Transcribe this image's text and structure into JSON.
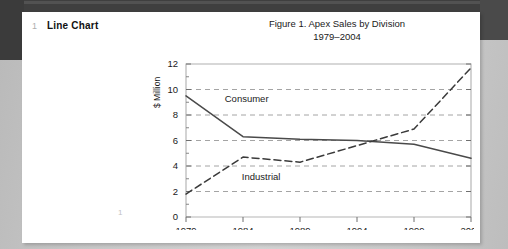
{
  "document": {
    "section_number": "1",
    "section_title": "Line Chart",
    "folio": "1"
  },
  "chart_data": {
    "type": "line",
    "title": "Figure 1.  Apex Sales by Division",
    "subtitle": "1979–2004",
    "xlabel": "",
    "ylabel": "$ Million",
    "categories": [
      "1979",
      "1984",
      "1989",
      "1994",
      "1999",
      "2004"
    ],
    "x": [
      1979,
      1984,
      1989,
      1994,
      1999,
      2004
    ],
    "xlim": [
      1979,
      2004
    ],
    "ylim": [
      0,
      12
    ],
    "yticks": [
      "0",
      "2",
      "4",
      "6",
      "8",
      "10",
      "12"
    ],
    "ytick_values": [
      0,
      2,
      4,
      6,
      8,
      10,
      12
    ],
    "grid": "horizontal-dashed",
    "legend": "inline-annotations",
    "series": [
      {
        "name": "Consumer",
        "style": "solid",
        "color": "#4a4a4a",
        "values": [
          9.5,
          6.3,
          6.1,
          6.0,
          5.7,
          4.6
        ],
        "label": "Consumer"
      },
      {
        "name": "Industrial",
        "style": "dashed",
        "color": "#3a3a3a",
        "values": [
          1.8,
          4.7,
          4.3,
          5.6,
          6.9,
          11.7
        ],
        "label": "Industrial"
      }
    ],
    "annotations": [
      {
        "text": "Consumer",
        "x": 1982.4,
        "y": 9.0
      },
      {
        "text": "Industrial",
        "x": 1983.9,
        "y": 2.9
      }
    ]
  }
}
